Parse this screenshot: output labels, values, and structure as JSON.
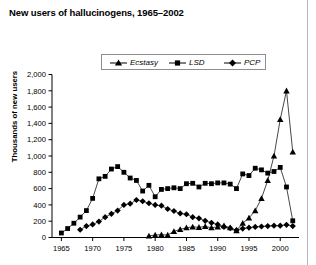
{
  "chart_data": {
    "type": "line",
    "title": "New users of hallucinogens, 1965–2002",
    "xlabel": "",
    "ylabel": "Thousands of new users",
    "xlim": [
      1963.5,
      2003.0
    ],
    "ylim": [
      0,
      2000
    ],
    "ytick_values": [
      0,
      200,
      400,
      600,
      800,
      1000,
      1200,
      1400,
      1600,
      1800,
      2000
    ],
    "ytick_labels": [
      "0",
      "200",
      "400",
      "600",
      "800",
      "1,000",
      "1,200",
      "1,400",
      "1,600",
      "1,800",
      "2,000"
    ],
    "xtick_values": [
      1965,
      1970,
      1975,
      1980,
      1985,
      1990,
      1995,
      2000
    ],
    "xtick_labels": [
      "1965",
      "1970",
      "1975",
      "1980",
      "1985",
      "1990",
      "1995",
      "2000"
    ],
    "grid": false,
    "legend_position": "top-center",
    "marker_color": "#000000",
    "line_color": "#333333",
    "x": [
      1965,
      1966,
      1967,
      1968,
      1969,
      1970,
      1971,
      1972,
      1973,
      1974,
      1975,
      1976,
      1977,
      1978,
      1979,
      1980,
      1981,
      1982,
      1983,
      1984,
      1985,
      1986,
      1987,
      1988,
      1989,
      1990,
      1991,
      1992,
      1993,
      1994,
      1995,
      1996,
      1997,
      1998,
      1999,
      2000,
      2001,
      2002
    ],
    "series": [
      {
        "name": "Ecstasy",
        "marker": "triangle",
        "start_year": 1979,
        "values": [
          null,
          null,
          null,
          null,
          null,
          null,
          null,
          null,
          null,
          null,
          null,
          null,
          null,
          null,
          20,
          30,
          35,
          30,
          75,
          100,
          120,
          130,
          125,
          135,
          120,
          130,
          145,
          120,
          85,
          175,
          240,
          330,
          480,
          700,
          1000,
          1450,
          1800,
          1050
        ]
      },
      {
        "name": "LSD",
        "marker": "square",
        "start_year": 1965,
        "values": [
          55,
          110,
          175,
          250,
          330,
          480,
          720,
          750,
          840,
          870,
          800,
          730,
          700,
          570,
          640,
          500,
          590,
          600,
          610,
          600,
          660,
          665,
          620,
          665,
          660,
          670,
          670,
          655,
          600,
          780,
          760,
          850,
          830,
          790,
          810,
          860,
          620,
          205
        ]
      },
      {
        "name": "PCP",
        "marker": "diamond",
        "start_year": 1968,
        "values": [
          null,
          null,
          null,
          95,
          140,
          160,
          195,
          250,
          290,
          330,
          400,
          415,
          460,
          445,
          420,
          400,
          390,
          350,
          325,
          295,
          285,
          250,
          235,
          205,
          180,
          160,
          130,
          115,
          90,
          110,
          120,
          130,
          135,
          140,
          145,
          145,
          155,
          140
        ]
      }
    ]
  },
  "legend": {
    "items": [
      {
        "label": "Ecstasy",
        "marker": "triangle"
      },
      {
        "label": "LSD",
        "marker": "square"
      },
      {
        "label": "PCP",
        "marker": "diamond"
      }
    ]
  }
}
